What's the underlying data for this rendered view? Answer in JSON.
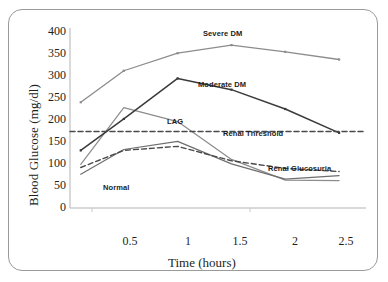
{
  "figure": {
    "border_color": "#9a9a9a",
    "background": "#ffffff"
  },
  "axes": {
    "y_title": "Blood Glucose (mg/dl)",
    "x_title": "Time (hours)",
    "y_ticks": [
      "400",
      "350",
      "300",
      "250",
      "200",
      "150",
      "100",
      "50",
      "0"
    ],
    "x_ticks": [
      "0.5",
      "1",
      "1.5",
      "2",
      "2.5"
    ],
    "axis_color": "#b3b3b3"
  },
  "series_labels": {
    "severe": "Severe DM",
    "moderate": "Moderate DM",
    "lag": "LAG",
    "renal_threshold": "Renal Threshold",
    "renal_glucosuria": "Renal Glucosuria",
    "normal": "Normal"
  },
  "colors": {
    "severe": "#8c8c8c",
    "moderate": "#3a3a3a",
    "lag": "#8c8c8c",
    "normal": "#6e6e6e",
    "renal_glucosuria": "#4a4a4a",
    "renal_threshold": "#4a4a4a"
  },
  "chart_data": {
    "type": "line",
    "title": "",
    "xlabel": "Time (hours)",
    "ylabel": "Blood Glucose (mg/dl)",
    "xlim": [
      0,
      2.75
    ],
    "ylim": [
      0,
      400
    ],
    "yticks": [
      0,
      50,
      100,
      150,
      200,
      250,
      300,
      350,
      400
    ],
    "xticks": [
      0.5,
      1,
      1.5,
      2,
      2.5
    ],
    "grid": false,
    "legend": "inline annotations",
    "series": [
      {
        "name": "Severe DM",
        "color": "#8c8c8c",
        "style": "solid",
        "x": [
          0.1,
          0.5,
          1.0,
          1.5,
          2.0,
          2.5
        ],
        "values": [
          235,
          305,
          344,
          362,
          347,
          330
        ]
      },
      {
        "name": "Moderate DM",
        "color": "#3a3a3a",
        "style": "solid",
        "x": [
          0.1,
          0.5,
          1.0,
          1.5,
          2.0,
          2.5
        ],
        "values": [
          128,
          198,
          288,
          263,
          220,
          167
        ]
      },
      {
        "name": "LAG",
        "color": "#8c8c8c",
        "style": "solid",
        "x": [
          0.1,
          0.5,
          1.0,
          1.5,
          2.0,
          2.5
        ],
        "values": [
          97,
          223,
          192,
          108,
          62,
          61
        ]
      },
      {
        "name": "Normal",
        "color": "#6e6e6e",
        "style": "solid",
        "x": [
          0.1,
          0.5,
          1.0,
          1.5,
          2.0,
          2.5
        ],
        "values": [
          75,
          130,
          148,
          98,
          64,
          72
        ]
      },
      {
        "name": "Renal Glucosuria",
        "color": "#4a4a4a",
        "style": "dashed",
        "x": [
          0.1,
          0.5,
          1.0,
          1.5,
          2.0,
          2.5
        ],
        "values": [
          90,
          128,
          137,
          105,
          88,
          81
        ]
      },
      {
        "name": "Renal Threshold",
        "color": "#4a4a4a",
        "style": "dashed",
        "x": [
          0.0,
          2.75
        ],
        "values": [
          170,
          170
        ],
        "annotation": "horizontal reference line at 170 mg/dl"
      }
    ]
  }
}
